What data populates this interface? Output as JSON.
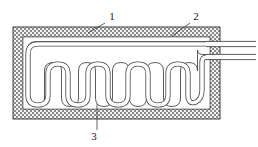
{
  "figure": {
    "type": "patent-line-drawing",
    "background_color": "#ffffff",
    "line_color": "#3c3c3c",
    "hatch_color": "#6e6e6e",
    "canvas": {
      "width": 258,
      "height": 147
    }
  },
  "reference_labels": [
    {
      "id": "label-1",
      "text": "1",
      "text_x": 112,
      "text_y": 20,
      "leader": {
        "x1": 105,
        "y1": 23,
        "x2": 88,
        "y2": 33
      },
      "points_to": "outer-enclosure-top-wall"
    },
    {
      "id": "label-2",
      "text": "2",
      "text_x": 196,
      "text_y": 20,
      "leader": {
        "x1": 190,
        "y1": 23,
        "x2": 172,
        "y2": 36
      },
      "points_to": "insulation-layer"
    },
    {
      "id": "label-3",
      "text": "3",
      "text_x": 94,
      "text_y": 138,
      "leader": {
        "x1": 97,
        "y1": 130,
        "x2": 97,
        "y2": 104
      },
      "points_to": "serpentine-tube"
    }
  ],
  "enclosure": {
    "outer": {
      "x": 13,
      "y": 27,
      "width": 207,
      "height": 92
    },
    "wall_thickness": 10,
    "inner_cavity": {
      "x": 23,
      "y": 37,
      "width": 187,
      "height": 72
    },
    "fill_pattern": "cross-hatch-checker"
  },
  "serpentine": {
    "tube_width": 5,
    "u_bend_count": 6,
    "inlet_side": "right",
    "outlet_side": "right",
    "path_description": "double-line tube entering top right, running left along top, descending at left end, weaving six U-bends to the right, then rising to exit right wall"
  },
  "outlet_tubes": [
    {
      "id": "outlet-tube-upper",
      "y_center": 44,
      "x_start": 213,
      "x_end": 256
    },
    {
      "id": "outlet-tube-lower",
      "y_center": 57,
      "x_start": 213,
      "x_end": 256
    }
  ]
}
